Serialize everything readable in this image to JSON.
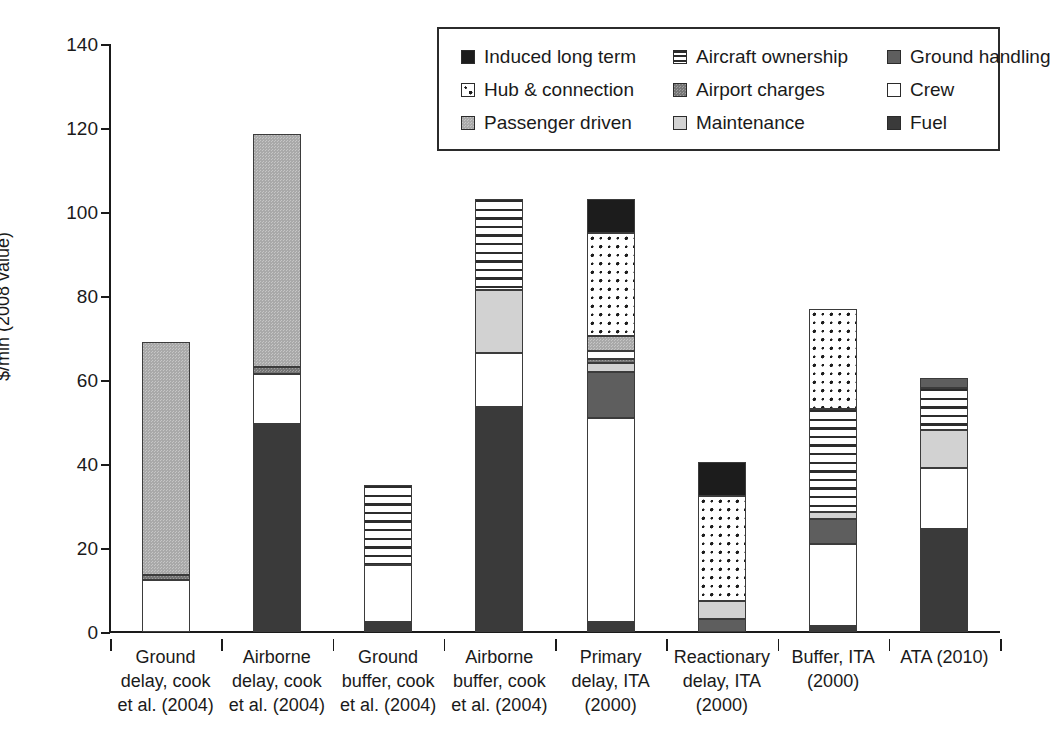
{
  "chart_data": {
    "type": "bar",
    "stacked": true,
    "title": "",
    "xlabel": "",
    "ylabel": "$/min (2008 value)",
    "ylim": [
      0,
      140
    ],
    "yticks": [
      0,
      20,
      40,
      60,
      80,
      100,
      120,
      140
    ],
    "grid": false,
    "legend_position": "top-right",
    "categories": [
      "Ground delay, cook et al. (2004)",
      "Airborne delay, cook et al. (2004)",
      "Ground buffer, cook et al. (2004)",
      "Airborne buffer, cook et al. (2004)",
      "Primary delay, ITA (2000)",
      "Reactionary delay, ITA (2000)",
      "Buffer, ITA (2000)",
      "ATA (2010)"
    ],
    "category_lines": [
      [
        "Ground",
        "delay, cook",
        "et al. (2004)"
      ],
      [
        "Airborne",
        "delay, cook",
        "et al. (2004)"
      ],
      [
        "Ground",
        "buffer, cook",
        "et al. (2004)"
      ],
      [
        "Airborne",
        "buffer, cook",
        "et al. (2004)"
      ],
      [
        "Primary",
        "delay, ITA",
        "(2000)"
      ],
      [
        "Reactionary",
        "delay, ITA",
        "(2000)"
      ],
      [
        "Buffer, ITA",
        "(2000)",
        ""
      ],
      [
        "ATA (2010)",
        "",
        ""
      ]
    ],
    "series": [
      {
        "name": "Fuel",
        "key": "fuel",
        "values": [
          0,
          49.5,
          2.5,
          53.5,
          2.5,
          0,
          1.5,
          24.5
        ]
      },
      {
        "name": "Crew",
        "key": "crew",
        "values": [
          12.5,
          12.0,
          13.5,
          13.0,
          48.5,
          0,
          19.5,
          14.5
        ]
      },
      {
        "name": "Maintenance",
        "key": "maintenance",
        "values": [
          0,
          0,
          0,
          15.0,
          2.0,
          4.5,
          1.5,
          9.0
        ]
      },
      {
        "name": "Airport charges",
        "key": "airport",
        "values": [
          1.0,
          1.5,
          0,
          0,
          1.0,
          0,
          0,
          0
        ]
      },
      {
        "name": "Passenger driven",
        "key": "passenger",
        "values": [
          55.5,
          55.5,
          0,
          0,
          3.5,
          0,
          0,
          0
        ]
      },
      {
        "name": "Ground handling",
        "key": "ground",
        "values": [
          0,
          0,
          0,
          0,
          11.0,
          3.0,
          6.0,
          2.5
        ]
      },
      {
        "name": "Aircraft ownership",
        "key": "ownership",
        "values": [
          0,
          0,
          19.0,
          21.5,
          0,
          0,
          24.5,
          10.0
        ]
      },
      {
        "name": "Hub & connection",
        "key": "hub",
        "values": [
          0,
          0,
          0,
          0,
          24.5,
          25.0,
          24.0,
          0
        ]
      },
      {
        "name": "Induced long term",
        "key": "induced",
        "values": [
          0,
          0,
          0,
          0,
          8.0,
          8.0,
          0,
          0
        ]
      }
    ],
    "totals": [
      69,
      118.5,
      35,
      103,
      103,
      40.5,
      77,
      60.5
    ],
    "stack_order_bottom_to_top": [
      "fuel",
      "crew",
      "ground",
      "maintenance",
      "crew2",
      "passenger",
      "airport",
      "ownership",
      "hub",
      "induced"
    ]
  },
  "axis": {
    "y_title": "$/min (2008 value)",
    "y_ticks": [
      "140",
      "120",
      "100",
      "80",
      "60",
      "40",
      "20",
      "0"
    ]
  },
  "legend": {
    "rows": [
      [
        {
          "label": "Induced long term",
          "icon": "swatch-induced-long-term"
        },
        {
          "label": "Aircraft ownership",
          "icon": "swatch-aircraft-ownership"
        },
        {
          "label": "Ground handling",
          "icon": "swatch-ground-handling"
        }
      ],
      [
        {
          "label": "Hub & connection",
          "icon": "swatch-hub-connection"
        },
        {
          "label": "Airport charges",
          "icon": "swatch-airport-charges"
        },
        {
          "label": "Crew",
          "icon": "swatch-crew"
        }
      ],
      [
        {
          "label": "Passenger driven",
          "icon": "swatch-passenger-driven"
        },
        {
          "label": "Maintenance",
          "icon": "swatch-maintenance"
        },
        {
          "label": "Fuel",
          "icon": "swatch-fuel"
        }
      ]
    ]
  },
  "colors": {
    "induced_long_term": "#1c1c1c",
    "aircraft_ownership": "#ffffff",
    "ground_handling": "#5e5e5e",
    "hub_connection": "#ffffff",
    "airport_charges": "#767676",
    "crew": "#ffffff",
    "passenger_driven": "#a9a9a9",
    "maintenance": "#d2d2d2",
    "fuel": "#3a3a3a",
    "axis": "#1a1a1a",
    "background": "#ffffff"
  }
}
